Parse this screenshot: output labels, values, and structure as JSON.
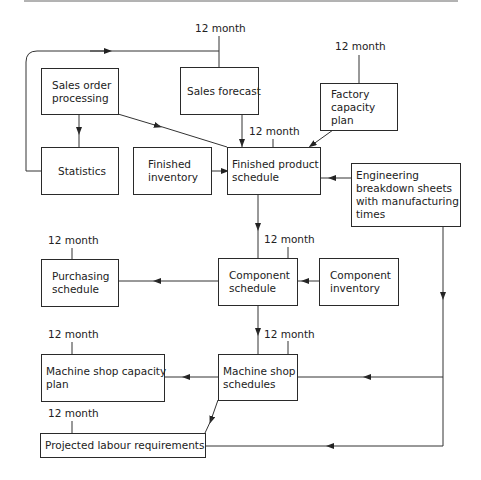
{
  "diagram": {
    "boxes": {
      "sales_order": [
        "Sales order",
        "processing"
      ],
      "sales_forecast": [
        "Sales forecast"
      ],
      "factory_capacity": [
        "Factory",
        "capacity",
        "plan"
      ],
      "statistics": [
        "Statistics"
      ],
      "finished_inventory": [
        "Finished",
        "inventory"
      ],
      "finished_product": [
        "Finished product",
        "schedule"
      ],
      "engineering": [
        "Engineering",
        "breakdown sheets",
        "with manufacturing",
        "times"
      ],
      "purchasing": [
        "Purchasing",
        "schedule"
      ],
      "component_schedule": [
        "Component",
        "schedule"
      ],
      "component_inventory": [
        "Component",
        "inventory"
      ],
      "machine_capacity": [
        "Machine shop capacity",
        "plan"
      ],
      "machine_schedules": [
        "Machine shop",
        "schedules"
      ],
      "labour": [
        "Projected labour requirements"
      ]
    },
    "horizon_label": "12 month"
  }
}
